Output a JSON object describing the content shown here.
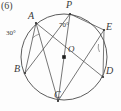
{
  "figure": {
    "problem_number": "(6)",
    "center_label": "O",
    "style": "scanned-textbook-line-drawing",
    "stroke_color": "#4a4a4a",
    "text_color": "#3a3a3a",
    "background_color": "#fdfdfd"
  },
  "points": [
    {
      "name": "P",
      "label": "P",
      "x": 70,
      "y": 14,
      "label_x": 66,
      "label_y": 0
    },
    {
      "name": "A",
      "label": "A",
      "x": 36,
      "y": 23,
      "label_x": 28,
      "label_y": 11
    },
    {
      "name": "E",
      "label": "E",
      "x": 104,
      "y": 30,
      "label_x": 106,
      "label_y": 22
    },
    {
      "name": "B",
      "label": "B",
      "x": 25,
      "y": 73,
      "label_x": 14,
      "label_y": 64
    },
    {
      "name": "D",
      "label": "D",
      "x": 103,
      "y": 77,
      "label_x": 106,
      "label_y": 66
    },
    {
      "name": "C",
      "label": "C",
      "x": 58,
      "y": 101,
      "label_x": 54,
      "label_y": 90
    }
  ],
  "center": {
    "name": "O",
    "x": 64,
    "y": 57,
    "label_x": 68,
    "label_y": 45
  },
  "circle": {
    "cx": 64,
    "cy": 57,
    "r": 43
  },
  "chords": [
    {
      "name": "chord-AB",
      "from": "A",
      "to": "B"
    },
    {
      "name": "chord-AC",
      "from": "A",
      "to": "C"
    },
    {
      "name": "chord-AD",
      "from": "A",
      "to": "D"
    },
    {
      "name": "chord-PB",
      "from": "P",
      "to": "B"
    },
    {
      "name": "chord-PC",
      "from": "P",
      "to": "C"
    },
    {
      "name": "chord-PE",
      "from": "P",
      "to": "E"
    },
    {
      "name": "chord-CE",
      "from": "C",
      "to": "E"
    },
    {
      "name": "chord-ED",
      "from": "E",
      "to": "D"
    }
  ],
  "angles": [
    {
      "name": "angle-at-A",
      "label": "30°",
      "vertex": "A",
      "label_x": 6,
      "label_y": 30
    },
    {
      "name": "angle-at-P",
      "label": "70°",
      "vertex": "P",
      "label_x": 59,
      "label_y": 22
    },
    {
      "name": "angle-at-E",
      "label": "",
      "vertex": "E",
      "label_x": 94,
      "label_y": 54
    }
  ]
}
